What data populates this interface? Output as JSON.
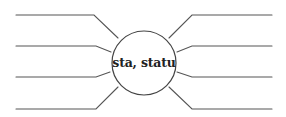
{
  "diagram": {
    "type": "word-web",
    "center_label": "sta, statu",
    "stroke_color": "#555555",
    "branches": {
      "left": [
        {
          "index": 1,
          "answer": ""
        },
        {
          "index": 2,
          "answer": ""
        },
        {
          "index": 3,
          "answer": ""
        },
        {
          "index": 4,
          "answer": ""
        }
      ],
      "right": [
        {
          "index": 1,
          "answer": ""
        },
        {
          "index": 2,
          "answer": ""
        },
        {
          "index": 3,
          "answer": ""
        },
        {
          "index": 4,
          "answer": ""
        }
      ]
    }
  }
}
